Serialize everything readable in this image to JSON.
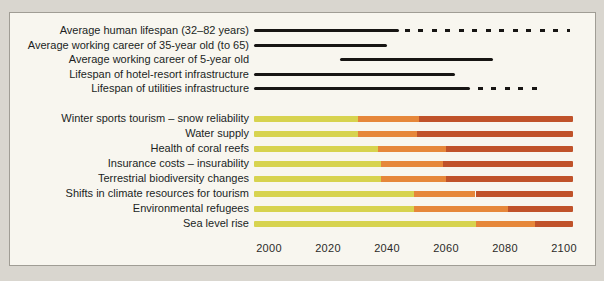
{
  "colors": {
    "outer_background": "#d9d6cf",
    "panel_background": "#f8f6ef",
    "panel_border": "#a09d95",
    "line_black": "#171513",
    "label_text": "#211f1e",
    "tick_text": "#2b2a28",
    "yellow": "#d7d34f",
    "orange": "#e6873a",
    "red": "#c0522a"
  },
  "chart_data": {
    "type": "bar",
    "orientation": "horizontal-timeline",
    "title": "",
    "xlabel": "",
    "ylabel": "",
    "grid": false,
    "legend": false,
    "axis": {
      "domain": [
        1995,
        2103
      ],
      "ticks": [
        "2000",
        "2020",
        "2040",
        "2060",
        "2080",
        "2100"
      ],
      "tick_values": [
        2000,
        2020,
        2040,
        2060,
        2080,
        2100
      ]
    },
    "lifespan_series": [
      {
        "label": "Average human lifespan (32–82 years)",
        "solid": [
          1995,
          2044
        ],
        "dashed": [
          2046,
          2102
        ]
      },
      {
        "label": "Average working career of 35-year old (to 65)",
        "solid": [
          1995,
          2040
        ],
        "dashed": null
      },
      {
        "label": "Average working career of 5-year old",
        "solid": [
          2024,
          2076
        ],
        "dashed": null
      },
      {
        "label": "Lifespan of hotel-resort infrastructure",
        "solid": [
          1995,
          2063
        ],
        "dashed": null
      },
      {
        "label": "Lifespan of utilities infrastructure",
        "solid": [
          1995,
          2068
        ],
        "dashed": [
          2071,
          2093
        ]
      }
    ],
    "impact_series": [
      {
        "label": "Winter sports tourism – snow reliability",
        "start": 1995,
        "to_orange": 2030,
        "to_red": 2051,
        "end": 2103
      },
      {
        "label": "Water supply",
        "start": 1995,
        "to_orange": 2030,
        "to_red": 2050,
        "end": 2103
      },
      {
        "label": "Health of coral reefs",
        "start": 1995,
        "to_orange": 2037,
        "to_red": 2060,
        "end": 2103
      },
      {
        "label": "Insurance costs – insurability",
        "start": 1995,
        "to_orange": 2038,
        "to_red": 2059,
        "end": 2103
      },
      {
        "label": "Terrestrial biodiversity changes",
        "start": 1995,
        "to_orange": 2038,
        "to_red": 2060,
        "end": 2103
      },
      {
        "label": "Shifts in climate resources for tourism",
        "start": 1995,
        "to_orange": 2049,
        "to_red": 2070,
        "end": 2103
      },
      {
        "label": "Environmental refugees",
        "start": 1995,
        "to_orange": 2049,
        "to_red": 2081,
        "end": 2103
      },
      {
        "label": "Sea level rise",
        "start": 1995,
        "to_orange": 2070,
        "to_red": 2090,
        "end": 2103
      }
    ]
  }
}
